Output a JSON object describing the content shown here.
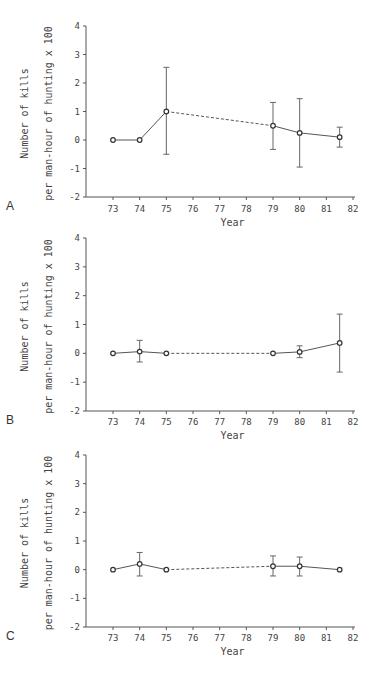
{
  "chart_data": [
    {
      "type": "line",
      "panel": "A",
      "title": "",
      "xlabel": "Year",
      "ylabel_line1": "Number of kills",
      "ylabel_line2": "per man-hour of hunting x 100",
      "xticks": [
        73,
        74,
        75,
        76,
        77,
        78,
        79,
        80,
        81,
        82
      ],
      "yticks": [
        -2,
        -1,
        0,
        1,
        2,
        3,
        4
      ],
      "xlim": [
        72,
        82
      ],
      "ylim": [
        -2,
        4
      ],
      "grid": false,
      "series": [
        {
          "name": "kills",
          "x": [
            73,
            74,
            75,
            79,
            80,
            81.5
          ],
          "y": [
            0,
            0,
            1.0,
            0.5,
            0.25,
            0.1
          ],
          "error_low": [
            null,
            null,
            -0.5,
            -0.33,
            -0.95,
            -0.25
          ],
          "error_high": [
            null,
            null,
            2.55,
            1.32,
            1.45,
            0.45
          ],
          "dashed_segments": [
            [
              75,
              79
            ]
          ]
        }
      ]
    },
    {
      "type": "line",
      "panel": "B",
      "title": "",
      "xlabel": "Year",
      "ylabel_line1": "Number of kills",
      "ylabel_line2": "per man-hour of hunting x 100",
      "xticks": [
        73,
        74,
        75,
        76,
        77,
        78,
        79,
        80,
        81,
        82
      ],
      "yticks": [
        -2,
        -1,
        0,
        1,
        2,
        3,
        4
      ],
      "xlim": [
        72,
        82
      ],
      "ylim": [
        -2,
        4
      ],
      "grid": false,
      "series": [
        {
          "name": "kills",
          "x": [
            73,
            74,
            75,
            79,
            80,
            81.5
          ],
          "y": [
            0,
            0.06,
            0,
            0,
            0.05,
            0.36
          ],
          "error_low": [
            null,
            -0.3,
            null,
            null,
            -0.15,
            -0.65
          ],
          "error_high": [
            null,
            0.45,
            null,
            null,
            0.26,
            1.36
          ],
          "dashed_segments": [
            [
              75,
              79
            ]
          ]
        }
      ]
    },
    {
      "type": "line",
      "panel": "C",
      "title": "",
      "xlabel": "Year",
      "ylabel_line1": "Number of kills",
      "ylabel_line2": "per man-hour of hunting x 100",
      "xticks": [
        73,
        74,
        75,
        76,
        77,
        78,
        79,
        80,
        81,
        82
      ],
      "yticks": [
        -2,
        -1,
        0,
        1,
        2,
        3,
        4
      ],
      "xlim": [
        72,
        82
      ],
      "ylim": [
        -2,
        4
      ],
      "grid": false,
      "series": [
        {
          "name": "kills",
          "x": [
            73,
            74,
            75,
            79,
            80,
            81.5
          ],
          "y": [
            0,
            0.2,
            0,
            0.12,
            0.12,
            0
          ],
          "error_low": [
            null,
            -0.22,
            null,
            -0.22,
            -0.22,
            null
          ],
          "error_high": [
            null,
            0.6,
            null,
            0.48,
            0.44,
            null
          ],
          "dashed_segments": [
            [
              75,
              79
            ]
          ]
        }
      ]
    }
  ]
}
